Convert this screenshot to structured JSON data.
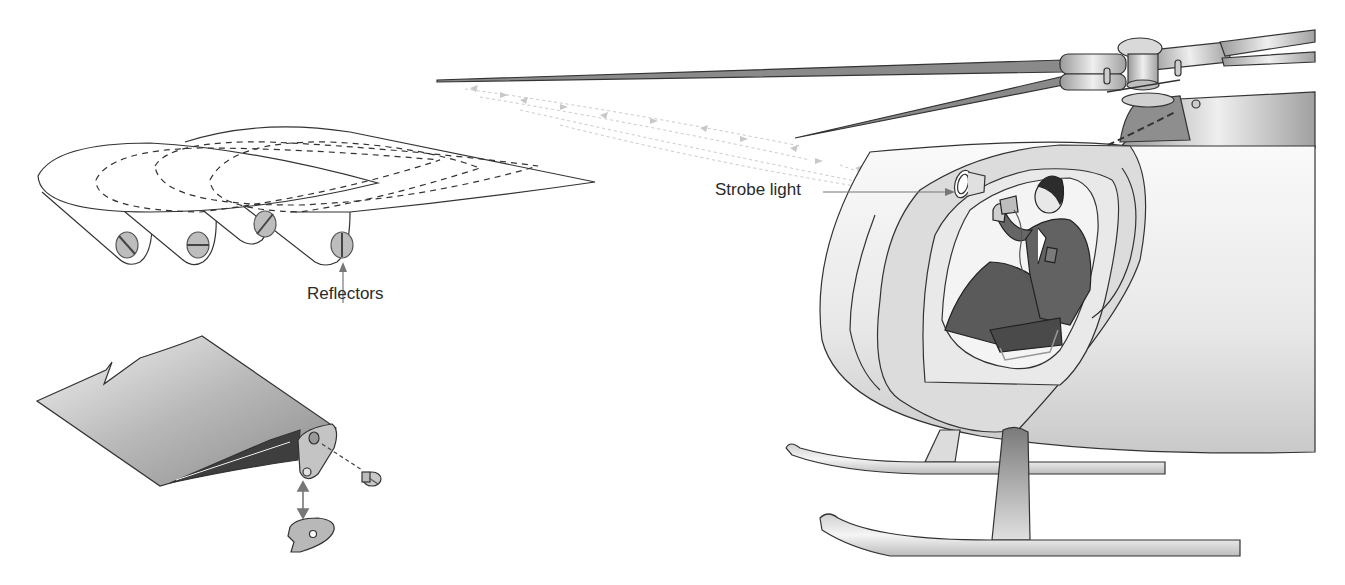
{
  "figure": {
    "type": "technical-illustration",
    "panels": [
      {
        "id": "rotor-tip-reflectors",
        "description": "Overlapping blade tips each fitted with a reflector (slotted disc) at different orientations"
      },
      {
        "id": "blade-tip-exploded",
        "description": "Blade tip with reflector bracket, screw and reflector cap (exploded view)"
      },
      {
        "id": "helicopter-cockpit",
        "description": "Pilot in cockpit aiming strobe light at rotating blades"
      }
    ]
  },
  "labels": {
    "reflectors": "Reflectors",
    "strobe_light": "Strobe light"
  },
  "reflectors": [
    {
      "index": 1,
      "slot_angle": "diagonal-down"
    },
    {
      "index": 2,
      "slot_angle": "horizontal"
    },
    {
      "index": 3,
      "slot_angle": "diagonal-up"
    },
    {
      "index": 4,
      "slot_angle": "vertical"
    }
  ],
  "colors": {
    "line": "#333333",
    "fill_light": "#e6e6e6",
    "fill_mid": "#bdbdbd",
    "fill_dark": "#6a6a6a",
    "arrows": "#c8c8c8",
    "label_arrow": "#777777"
  }
}
